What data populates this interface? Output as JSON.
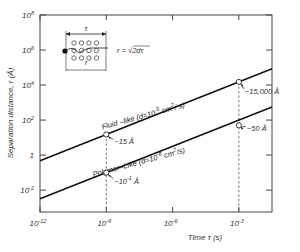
{
  "chart_data": {
    "type": "line",
    "title": "",
    "xlabel": "Time τ (s)",
    "ylabel": "Separation distance, r (Å)",
    "xscale": "log",
    "yscale": "log",
    "xlim_log10": [
      -12,
      -1.5
    ],
    "ylim_log10": [
      -3.25,
      8
    ],
    "grid": false,
    "x_ticks": [
      {
        "exp": -12,
        "label": "10",
        "sup": "-12"
      },
      {
        "exp": -9,
        "label": "10",
        "sup": "-9"
      },
      {
        "exp": -6,
        "label": "10",
        "sup": "-6"
      },
      {
        "exp": -3,
        "label": "10",
        "sup": "-3"
      }
    ],
    "y_ticks": [
      {
        "exp": 8,
        "label": "10",
        "sup": "8"
      },
      {
        "exp": 6,
        "label": "10",
        "sup": "6"
      },
      {
        "exp": 4,
        "label": "10",
        "sup": "4"
      },
      {
        "exp": 2,
        "label": "10",
        "sup": "2"
      },
      {
        "exp": 0,
        "label": "1",
        "sup": ""
      },
      {
        "exp": -2,
        "label": "10",
        "sup": "-2"
      }
    ],
    "series": [
      {
        "name": "Fluid-like",
        "label": "Fluid –like (d=10",
        "label_sup": "-5",
        "label_tail": " cm",
        "label_sup2": "2",
        "label_end": "/ s)",
        "diffusivity_cm2_per_s": 1e-05,
        "x_log10": [
          -12,
          -1.5
        ],
        "y_log10": [
          -0.32,
          4.93
        ],
        "points": [
          {
            "x_log10": -9,
            "y_log10": 1.18,
            "annotation": "~15 Å"
          },
          {
            "x_log10": -3,
            "y_log10": 4.18,
            "annotation": "~15,000 Å"
          }
        ]
      },
      {
        "name": "Polymer-like",
        "label": "Polymer–Like (d=10",
        "label_sup": "-8",
        "label_tail": " cm",
        "label_sup2": "2",
        "label_end": "/s)",
        "diffusivity_cm2_per_s": 1e-08,
        "x_log10": [
          -12,
          -1.5
        ],
        "y_log10": [
          -2.5,
          2.75
        ],
        "points": [
          {
            "x_log10": -9,
            "y_log10": -1.0,
            "annotation": "~10",
            "annotation_sup": "-1",
            "annotation_unit": " Å"
          },
          {
            "x_log10": -3,
            "y_log10": 1.7,
            "annotation": "~50 Å"
          }
        ]
      }
    ],
    "reference_lines_x_log10": [
      -9,
      -3
    ],
    "inset": {
      "tau_label": "τ",
      "r_label": "r",
      "formula": "r = √2dτ"
    }
  }
}
